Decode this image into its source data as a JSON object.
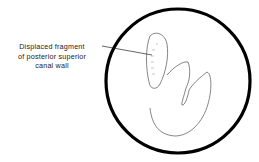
{
  "figure": {
    "label_lines": [
      "Displaced fragment",
      "of posterior superior",
      "canal wall"
    ],
    "colors": {
      "stroke": "#000000",
      "background": "#ffffff"
    }
  }
}
